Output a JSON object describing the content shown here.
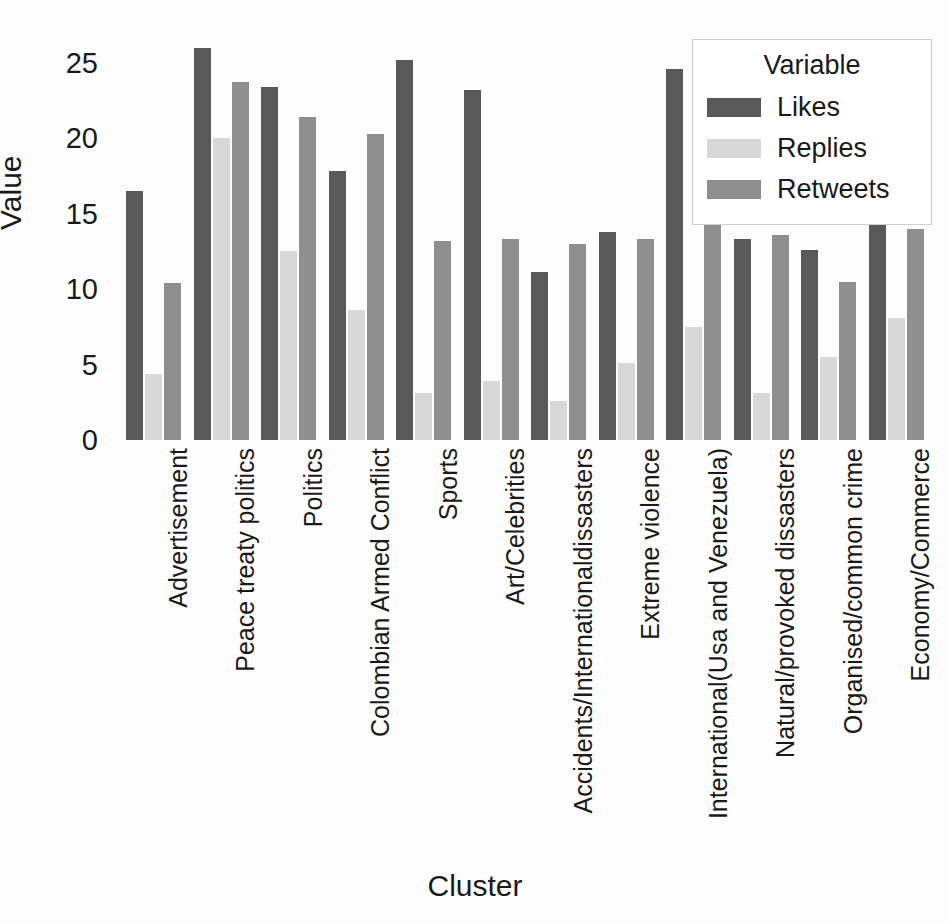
{
  "chart_data": {
    "type": "bar",
    "title": "",
    "xlabel": "Cluster",
    "ylabel": "Value",
    "ylim": [
      0,
      26.5
    ],
    "yticks": [
      0,
      5,
      10,
      15,
      20,
      25
    ],
    "grid": false,
    "legend": {
      "title": "Variable",
      "position": "top-right",
      "entries": [
        {
          "name": "Likes",
          "color": "#595959"
        },
        {
          "name": "Replies",
          "color": "#d8d8d8"
        },
        {
          "name": "Retweets",
          "color": "#8f8f8f"
        }
      ]
    },
    "categories": [
      "Advertisement",
      "Peace treaty politics",
      "Politics",
      "Colombian Armed Conflict",
      "Sports",
      "Art/Celebrities",
      "Accidents/Internationaldissasters",
      "Extreme violence",
      "International(Usa and Venezuela)",
      "Natural/provoked dissasters",
      "Organised/common crime",
      "Economy/Commerce"
    ],
    "series": [
      {
        "name": "Likes",
        "color": "#595959",
        "values": [
          16.5,
          26.0,
          23.4,
          17.8,
          25.2,
          23.2,
          11.1,
          13.8,
          24.6,
          13.3,
          12.6,
          14.9
        ]
      },
      {
        "name": "Replies",
        "color": "#d8d8d8",
        "values": [
          4.4,
          20.0,
          12.5,
          8.6,
          3.1,
          3.9,
          2.6,
          5.1,
          7.5,
          3.1,
          5.5,
          8.1
        ]
      },
      {
        "name": "Retweets",
        "color": "#8f8f8f",
        "values": [
          10.4,
          23.7,
          21.4,
          20.3,
          13.2,
          13.3,
          13.0,
          13.3,
          15.5,
          13.6,
          10.5,
          14.0
        ]
      }
    ]
  }
}
